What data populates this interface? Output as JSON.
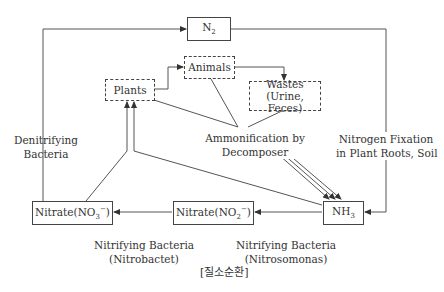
{
  "diagram": {
    "title_caption": "[질소순환]",
    "nodes": {
      "n2": {
        "label": "N",
        "sub": "2"
      },
      "animals": {
        "label": "Animals"
      },
      "plants": {
        "label": "Plants"
      },
      "wastes": {
        "line1": "Wastes",
        "line2": "(Urine, Feces)"
      },
      "nitrate_no3": {
        "label": "Nitrate(NO",
        "sub": "3",
        "sup": "−",
        "tail": ")"
      },
      "nitrate_no2": {
        "label": "Nitrate(NO",
        "sub": "2",
        "sup": "−",
        "tail": ")"
      },
      "nh3": {
        "label": "NH",
        "sub": "3"
      }
    },
    "labels": {
      "denitrifying_1": "Denitrifying",
      "denitrifying_2": "Bacteria",
      "ammonification_1": "Ammonification by",
      "ammonification_2": "Decomposer",
      "fixation_1": "Nitrogen Fixation",
      "fixation_2": "in Plant Roots, Soil",
      "nitrobacter_1": "Nitrifying Bacteria",
      "nitrobacter_2": "(Nitrobactet)",
      "nitrosomonas_1": "Nitrifying Bacteria",
      "nitrosomonas_2": "(Nitrosomonas)"
    }
  }
}
